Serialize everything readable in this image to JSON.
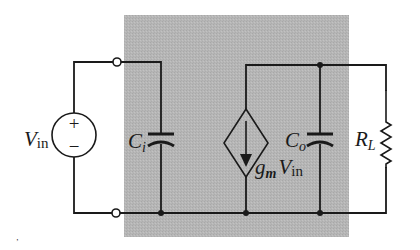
{
  "diagram": {
    "type": "circuit-schematic",
    "title": "",
    "background_box_color": "#b4b4b4",
    "wire_color": "#1a1a1a",
    "components": {
      "source": {
        "label_main": "V",
        "label_sub": "in",
        "plus_sign": "+",
        "minus_sign": "−"
      },
      "input_capacitor": {
        "label_main": "C",
        "label_sub": "i"
      },
      "dependent_current_source": {
        "label_g": "g",
        "label_g_sub": "m",
        "label_v": "V",
        "label_v_sub": "in"
      },
      "output_capacitor": {
        "label_main": "C",
        "label_sub": "o"
      },
      "load_resistor": {
        "label_main": "R",
        "label_sub": "L"
      }
    },
    "stray_mark": "’"
  }
}
